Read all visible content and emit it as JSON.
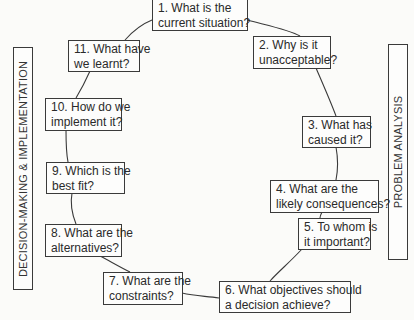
{
  "diagram": {
    "nodes": [
      {
        "id": 1,
        "line1": "1. What is the",
        "line2": "current situation?"
      },
      {
        "id": 2,
        "line1": "2. Why is it",
        "line2": "unacceptable?"
      },
      {
        "id": 3,
        "line1": "3. What has",
        "line2": "caused it?"
      },
      {
        "id": 4,
        "line1": "4. What are the",
        "line2": "likely consequences?"
      },
      {
        "id": 5,
        "line1": "5. To whom is",
        "line2": "it important?"
      },
      {
        "id": 6,
        "line1": "6. What objectives should",
        "line2": "a decision achieve?"
      },
      {
        "id": 7,
        "line1": "7. What are the",
        "line2": "constraints?"
      },
      {
        "id": 8,
        "line1": "8. What are the",
        "line2": "alternatives?"
      },
      {
        "id": 9,
        "line1": "9. Which is the",
        "line2": "best fit?"
      },
      {
        "id": 10,
        "line1": "10. How do we",
        "line2": "implement it?"
      },
      {
        "id": 11,
        "line1": "11. What have",
        "line2": "we learnt?"
      }
    ],
    "side_labels": {
      "left": "DECISION-MAKING & IMPLEMENTATION",
      "right": "PROBLEM ANALYSIS"
    }
  }
}
